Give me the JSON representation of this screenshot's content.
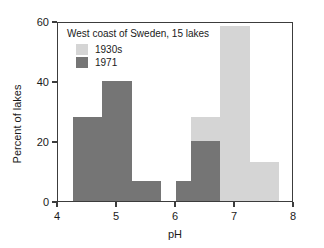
{
  "chart_data": {
    "type": "bar",
    "title": "West coast of Sweden, 15 lakes",
    "xlabel": "pH",
    "ylabel": "Percent of lakes",
    "xlim": [
      4,
      8
    ],
    "ylim": [
      0,
      60
    ],
    "xticks": [
      "4",
      "5",
      "6",
      "7",
      "8"
    ],
    "xtick_values": [
      4,
      5,
      6,
      7,
      8
    ],
    "yticks": [
      "0",
      "20",
      "40",
      "60"
    ],
    "ytick_values": [
      0,
      20,
      40,
      60
    ],
    "grid": false,
    "legend_position": "top-left",
    "bin_width": 0.5,
    "series": [
      {
        "name": "1930s",
        "color": "#d5d5d5",
        "bins": [
          {
            "x_start": 6.25,
            "x_end": 6.75,
            "value": 28,
            "stack_base": 20
          },
          {
            "x_start": 6.75,
            "x_end": 7.25,
            "value": 58.5,
            "stack_base": 0
          },
          {
            "x_start": 7.25,
            "x_end": 7.75,
            "value": 13,
            "stack_base": 0
          }
        ]
      },
      {
        "name": "1971",
        "color": "#757575",
        "bins": [
          {
            "x_start": 4.25,
            "x_end": 4.75,
            "value": 28,
            "stack_base": 0
          },
          {
            "x_start": 4.75,
            "x_end": 5.25,
            "value": 40,
            "stack_base": 0
          },
          {
            "x_start": 5.25,
            "x_end": 5.75,
            "value": 6.7,
            "stack_base": 0
          },
          {
            "x_start": 6.0,
            "x_end": 6.5,
            "value": 6.7,
            "stack_base": 0
          },
          {
            "x_start": 6.25,
            "x_end": 6.75,
            "value": 20,
            "stack_base": 0
          }
        ]
      }
    ]
  },
  "legend": {
    "title": "West coast of Sweden, 15 lakes",
    "entries": [
      {
        "label": "1930s",
        "color": "#d5d5d5"
      },
      {
        "label": "1971",
        "color": "#757575"
      }
    ]
  },
  "colors": {
    "series_1930s": "#d5d5d5",
    "series_1971": "#757575",
    "axis": "#3c3c3c",
    "text": "#1a1a1a",
    "background": "#ffffff"
  }
}
